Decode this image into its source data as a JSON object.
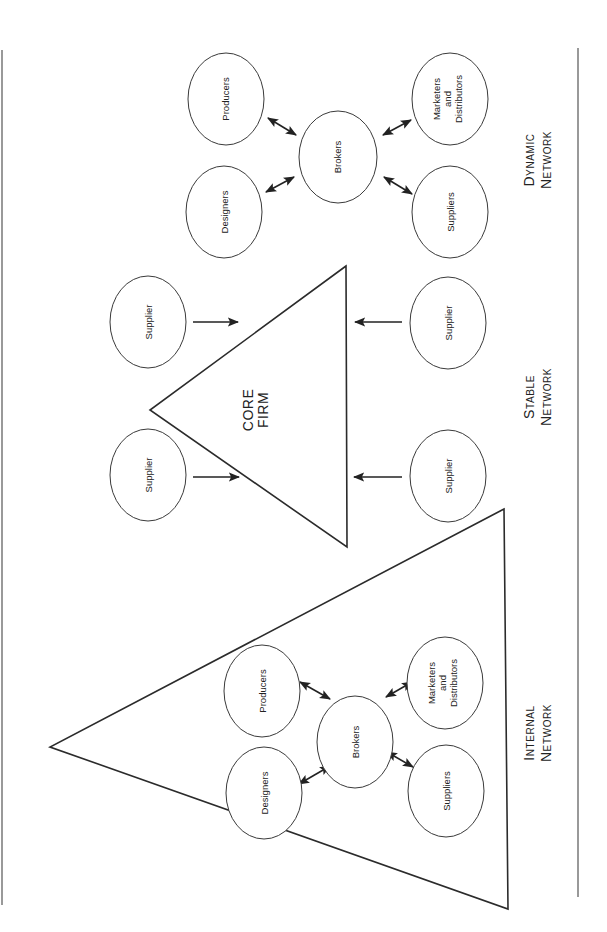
{
  "diagram": {
    "orientation": "rotated-90-ccw",
    "colors": {
      "line": "#2b2b2b",
      "background": "#ffffff",
      "text": "#222222"
    },
    "dynamic_network": {
      "caption_line1": "Dynamic",
      "caption_line2": "Network",
      "nodes": {
        "producers": "Producers",
        "designers": "Designers",
        "brokers": "Brokers",
        "marketers_line1": "Marketers",
        "marketers_line2": "and",
        "marketers_line3": "Distributors",
        "suppliers": "Suppliers"
      },
      "edges": [
        [
          "Brokers",
          "Producers",
          "bidirectional"
        ],
        [
          "Brokers",
          "Designers",
          "bidirectional"
        ],
        [
          "Brokers",
          "Marketers and Distributors",
          "bidirectional"
        ],
        [
          "Brokers",
          "Suppliers",
          "bidirectional"
        ]
      ]
    },
    "stable_network": {
      "caption_line1": "Stable",
      "caption_line2": "Network",
      "core_line1": "CORE",
      "core_line2": "FIRM",
      "suppliers": [
        "Supplier",
        "Supplier",
        "Supplier",
        "Supplier"
      ],
      "edges": [
        [
          "Supplier",
          "Core Firm",
          "directed"
        ],
        [
          "Supplier",
          "Core Firm",
          "directed"
        ],
        [
          "Supplier",
          "Core Firm",
          "directed"
        ],
        [
          "Supplier",
          "Core Firm",
          "directed"
        ]
      ]
    },
    "internal_network": {
      "caption_line1": "Internal",
      "caption_line2": "Network",
      "nodes": {
        "producers": "Producers",
        "designers": "Designers",
        "brokers": "Brokers",
        "marketers_line1": "Marketers",
        "marketers_line2": "and",
        "marketers_line3": "Distributors",
        "suppliers": "Suppliers"
      },
      "edges": [
        [
          "Brokers",
          "Producers",
          "bidirectional"
        ],
        [
          "Brokers",
          "Designers",
          "bidirectional"
        ],
        [
          "Brokers",
          "Marketers and Distributors",
          "bidirectional"
        ],
        [
          "Brokers",
          "Suppliers",
          "bidirectional"
        ]
      ]
    }
  }
}
